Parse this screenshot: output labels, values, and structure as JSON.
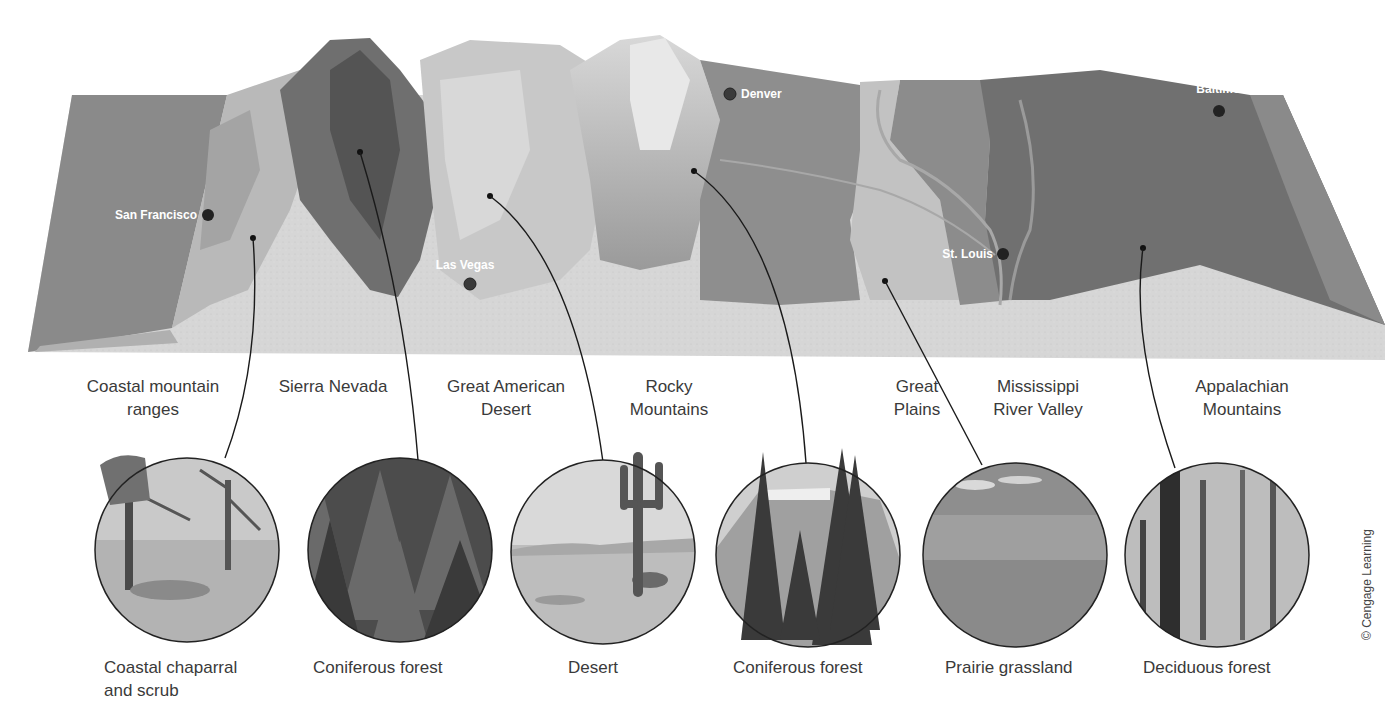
{
  "cities": [
    {
      "name": "San Francisco",
      "x": 208,
      "y": 215
    },
    {
      "name": "Las Vegas",
      "x": 470,
      "y": 284
    },
    {
      "name": "Denver",
      "x": 730,
      "y": 94
    },
    {
      "name": "St. Louis",
      "x": 1003,
      "y": 254
    },
    {
      "name": "Baltimore",
      "x": 1219,
      "y": 111
    }
  ],
  "regions": [
    {
      "name": "Coastal mountain ranges",
      "line1": "Coastal mountain",
      "line2": "ranges",
      "x": 153
    },
    {
      "name": "Sierra Nevada",
      "line1": "Sierra Nevada",
      "line2": "",
      "x": 333
    },
    {
      "name": "Great American Desert",
      "line1": "Great American",
      "line2": "Desert",
      "x": 506
    },
    {
      "name": "Rocky Mountains",
      "line1": "Rocky",
      "line2": "Mountains",
      "x": 669
    },
    {
      "name": "Great Plains",
      "line1": "Great",
      "line2": "Plains",
      "x": 917
    },
    {
      "name": "Mississippi River Valley",
      "line1": "Mississippi",
      "line2": "River Valley",
      "x": 1038
    },
    {
      "name": "Appalachian Mountains",
      "line1": "Appalachian",
      "line2": "Mountains",
      "x": 1242
    }
  ],
  "biomes": [
    {
      "line1": "Coastal chaparral",
      "line2": "and scrub",
      "photo": "oak trees and grassy scrub"
    },
    {
      "line1": "Coniferous forest",
      "line2": "",
      "photo": "dense conifer stand"
    },
    {
      "line1": "Desert",
      "line2": "",
      "photo": "saguaro cactus in desert"
    },
    {
      "line1": "Coniferous forest",
      "line2": "",
      "photo": "spruce trees and mountain"
    },
    {
      "line1": "Prairie grassland",
      "line2": "",
      "photo": "open prairie with clouds"
    },
    {
      "line1": "Deciduous forest",
      "line2": "",
      "photo": "broadleaf forest trunks"
    }
  ],
  "credit": "© Cengage Learning"
}
